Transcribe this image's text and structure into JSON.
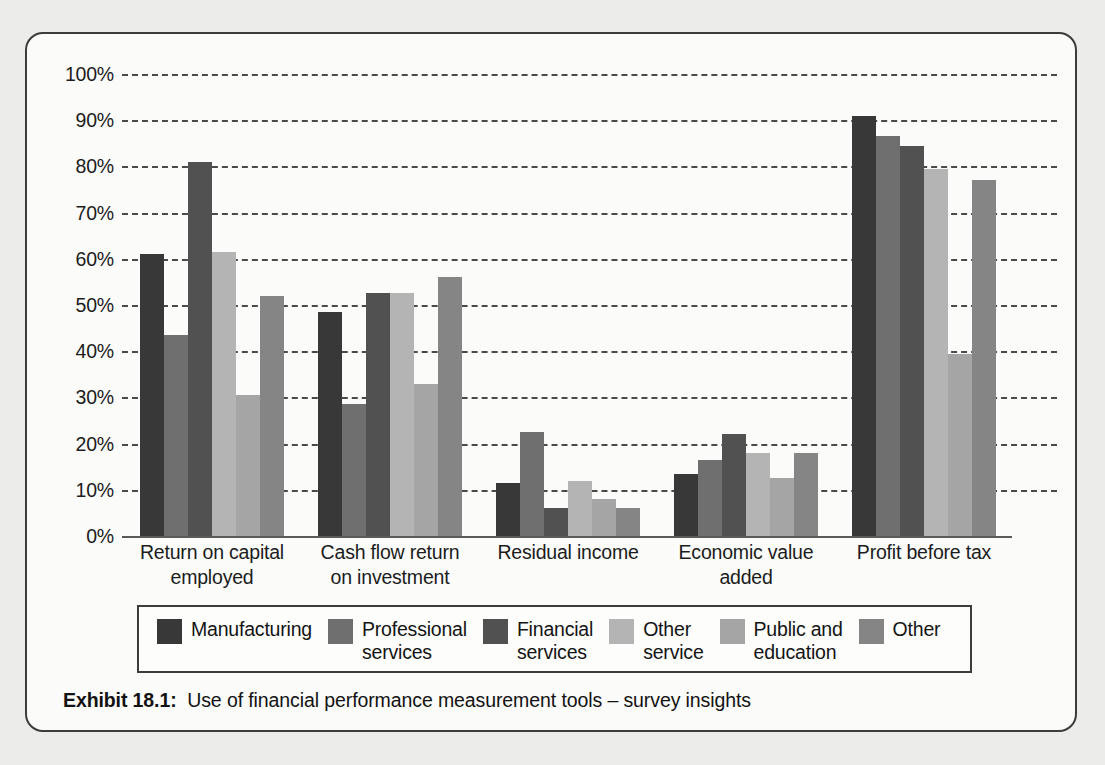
{
  "caption": {
    "label": "Exhibit 18.1:",
    "text": "Use of financial performance measurement tools  –  survey insights"
  },
  "legend": {
    "items": [
      {
        "label": "Manufacturing",
        "color": "#383838"
      },
      {
        "label": "Professional\nservices",
        "color": "#6f6f6f"
      },
      {
        "label": "Financial\nservices",
        "color": "#515151"
      },
      {
        "label": "Other\nservice",
        "color": "#b4b4b4"
      },
      {
        "label": "Public and\neducation",
        "color": "#a5a5a5"
      },
      {
        "label": "Other",
        "color": "#858585"
      }
    ]
  },
  "axis": {
    "yticks": [
      "0%",
      "10%",
      "20%",
      "30%",
      "40%",
      "50%",
      "60%",
      "70%",
      "80%",
      "90%",
      "100%"
    ]
  },
  "chart_data": {
    "type": "bar",
    "title": "Use of financial performance measurement tools – survey insights",
    "xlabel": "",
    "ylabel": "",
    "ylim": [
      0,
      100
    ],
    "ytick_step": 10,
    "grid": true,
    "legend_position": "bottom",
    "value_unit": "percent",
    "categories": [
      "Return on capital\nemployed",
      "Cash flow return\non investment",
      "Residual income",
      "Economic value\nadded",
      "Profit before tax"
    ],
    "series": [
      {
        "name": "Manufacturing",
        "color": "#383838",
        "values": [
          61.0,
          48.5,
          11.5,
          13.5,
          91.0
        ]
      },
      {
        "name": "Professional services",
        "color": "#6f6f6f",
        "values": [
          43.5,
          28.5,
          22.5,
          16.5,
          86.5
        ]
      },
      {
        "name": "Financial services",
        "color": "#515151",
        "values": [
          81.0,
          52.5,
          6.0,
          22.0,
          84.5
        ]
      },
      {
        "name": "Other service",
        "color": "#b4b4b4",
        "values": [
          61.5,
          52.5,
          12.0,
          18.0,
          79.5
        ]
      },
      {
        "name": "Public and education",
        "color": "#a5a5a5",
        "values": [
          30.5,
          33.0,
          8.0,
          12.5,
          39.5
        ]
      },
      {
        "name": "Other",
        "color": "#858585",
        "values": [
          52.0,
          56.0,
          6.0,
          18.0,
          77.0
        ]
      }
    ]
  }
}
